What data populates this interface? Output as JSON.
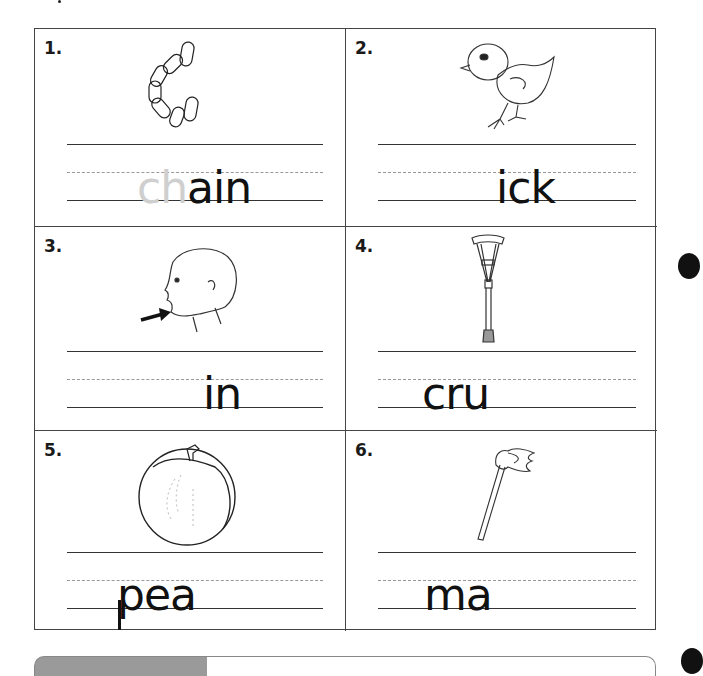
{
  "worksheet": {
    "title": "Digraph ch word completion",
    "items": [
      {
        "number": "1.",
        "picture": "chain",
        "traced_prefix": "ch",
        "given_letters": "ain",
        "full_word": "chain"
      },
      {
        "number": "2.",
        "picture": "chick",
        "traced_prefix": "",
        "given_letters": "ick",
        "full_word": "chick"
      },
      {
        "number": "3.",
        "picture": "chin",
        "traced_prefix": "",
        "given_letters": "in",
        "full_word": "chin"
      },
      {
        "number": "4.",
        "picture": "crutch",
        "traced_prefix": "",
        "given_letters": "cru",
        "full_word": "crutch"
      },
      {
        "number": "5.",
        "picture": "peach",
        "traced_prefix": "",
        "given_letters": "pea",
        "full_word": "peach"
      },
      {
        "number": "6.",
        "picture": "match",
        "traced_prefix": "",
        "given_letters": "ma",
        "full_word": "match"
      }
    ]
  },
  "colors": {
    "ink": "#111111",
    "trace": "#cfcfcf",
    "border": "#444444",
    "dashed": "#999999",
    "bar": "#9a9a9a"
  }
}
